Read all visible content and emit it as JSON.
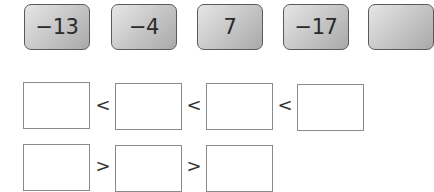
{
  "cards": [
    {
      "label": "−13"
    },
    {
      "label": "−4"
    },
    {
      "label": "7"
    },
    {
      "label": "−17"
    },
    {
      "label": ""
    }
  ],
  "rows": [
    {
      "signs": [
        "<",
        "<",
        "<"
      ],
      "box_count": 4
    },
    {
      "signs": [
        ">",
        ">"
      ],
      "box_count": 3
    }
  ],
  "colors": {
    "card_border": "#5a5a5a",
    "card_fill_light": "#e6e6e6",
    "card_fill_dark": "#a9a9a9",
    "box_border": "#8a8a8a"
  }
}
